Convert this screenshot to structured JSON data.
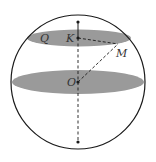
{
  "diagram": {
    "type": "sphere-cross-sections",
    "colors": {
      "background": "#ffffff",
      "outline": "#1a1a1a",
      "section_fill": "#9a9a9a",
      "label": "#333333"
    },
    "labels": {
      "Q": "Q",
      "K": "K",
      "M": "M",
      "O": "O"
    },
    "points": [
      {
        "id": "top-pole",
        "x": 78,
        "y": 22
      },
      {
        "id": "K",
        "x": 78,
        "y": 38
      },
      {
        "id": "M",
        "x": 118,
        "y": 44
      },
      {
        "id": "O",
        "x": 78,
        "y": 82
      },
      {
        "id": "bottom-pole",
        "x": 78,
        "y": 142
      }
    ],
    "sphere": {
      "cx": 78,
      "cy": 82,
      "r": 67
    },
    "small_circle_section": {
      "name": "Q",
      "cx": 78,
      "cy": 38,
      "rx": 52,
      "ry": 8
    },
    "great_circle_section": {
      "cx": 78,
      "cy": 82,
      "rx": 67,
      "ry": 12
    },
    "segments": [
      {
        "from": "top-pole",
        "to": "K",
        "style": "solid"
      },
      {
        "from": "K",
        "to": "bottom-pole",
        "style": "dashed"
      },
      {
        "from": "K",
        "to": "M",
        "style": "dashed"
      },
      {
        "from": "O",
        "to": "M",
        "style": "dashed"
      }
    ]
  }
}
